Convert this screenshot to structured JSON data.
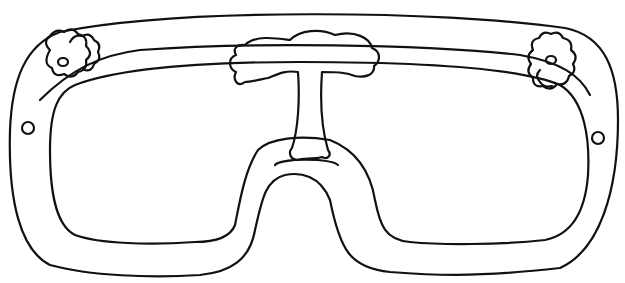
{
  "drawing": {
    "subject": "goggles line drawing",
    "stroke_color": "#111111",
    "background": "#ffffff",
    "elements": [
      {
        "name": "outer-frame"
      },
      {
        "name": "inner-lens-frame"
      },
      {
        "name": "left-flower"
      },
      {
        "name": "right-flower"
      },
      {
        "name": "center-tree"
      },
      {
        "name": "left-rivet"
      },
      {
        "name": "right-rivet"
      }
    ]
  }
}
